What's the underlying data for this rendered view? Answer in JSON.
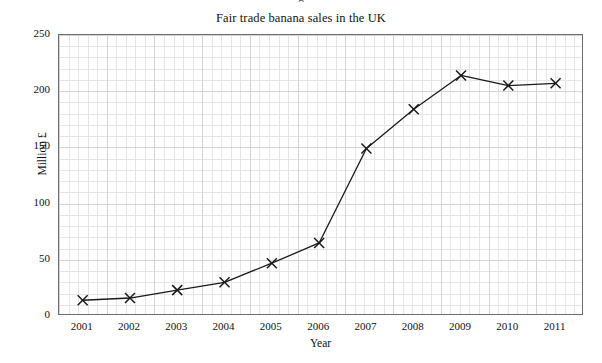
{
  "figure": {
    "clipped_top_text": "g",
    "background_color": "#ffffff",
    "frame_color": "#6d6d6d",
    "grid_minor_color": "#e9e4ea",
    "grid_major_color": "#d8d0da"
  },
  "chart_data": {
    "type": "line",
    "title": "Fair trade banana sales in the UK",
    "xlabel": "Year",
    "ylabel": "Million £",
    "categories": [
      "2001",
      "2002",
      "2003",
      "2004",
      "2005",
      "2006",
      "2007",
      "2008",
      "2009",
      "2010",
      "2011"
    ],
    "x": [
      2001,
      2002,
      2003,
      2004,
      2005,
      2006,
      2007,
      2008,
      2009,
      2010,
      2011
    ],
    "values": [
      14,
      16,
      23,
      30,
      47,
      65,
      149,
      184,
      214,
      205,
      207
    ],
    "series": [
      {
        "name": "Fair trade banana sales",
        "values": [
          14,
          16,
          23,
          30,
          47,
          65,
          149,
          184,
          214,
          205,
          207
        ],
        "marker": "x-cross",
        "line_color": "#1a1a1a",
        "marker_color": "#1a1a1a"
      }
    ],
    "xlim": [
      2000.5,
      2011.6
    ],
    "ylim": [
      0,
      250
    ],
    "ytick_labels": [
      "0",
      "50",
      "100",
      "150",
      "200",
      "250"
    ],
    "ytick_values": [
      0,
      50,
      100,
      150,
      200,
      250
    ],
    "ytick_minor_step": 10,
    "xtick_labels": [
      "2001",
      "2002",
      "2003",
      "2004",
      "2005",
      "2006",
      "2007",
      "2008",
      "2009",
      "2010",
      "2011"
    ],
    "grid": true,
    "grid_style": "minor and major light lavender grid",
    "legend": false,
    "legend_position": "none"
  }
}
